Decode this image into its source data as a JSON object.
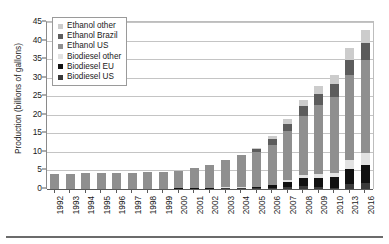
{
  "chart_data": {
    "type": "bar",
    "stacked": true,
    "title": "",
    "xlabel": "",
    "ylabel": "Production (billions of gallons)",
    "ylim": [
      0,
      45
    ],
    "ytick_step": 5,
    "yticks": [
      0,
      5,
      10,
      15,
      20,
      25,
      30,
      35,
      40,
      45
    ],
    "grid": true,
    "legend_position": "top-left",
    "categories": [
      "1992",
      "1993",
      "1994",
      "1995",
      "1996",
      "1997",
      "1998",
      "1999",
      "2000",
      "2001",
      "2002",
      "2003",
      "2004",
      "2005",
      "2006",
      "2007",
      "2008",
      "2009",
      "2010",
      "2013",
      "2016"
    ],
    "series": [
      {
        "name": "Biodiesel US",
        "color": "#3a3a3a",
        "values": [
          0,
          0,
          0,
          0,
          0,
          0,
          0,
          0,
          0,
          0,
          0,
          0.02,
          0.03,
          0.09,
          0.25,
          0.49,
          0.68,
          0.5,
          0.31,
          1.3,
          1.6
        ]
      },
      {
        "name": "Biodiesel EU",
        "color": "#111111",
        "values": [
          0,
          0,
          0,
          0,
          0,
          0,
          0,
          0,
          0.02,
          0.03,
          0.06,
          0.1,
          0.17,
          0.3,
          0.7,
          1.5,
          2.3,
          2.6,
          2.8,
          4.0,
          5.0
        ]
      },
      {
        "name": "Biodiesel other",
        "color": "#e2e2e2",
        "values": [
          0,
          0,
          0,
          0,
          0,
          0,
          0,
          0,
          0,
          0,
          0,
          0.02,
          0.05,
          0.1,
          0.2,
          0.4,
          0.7,
          1.0,
          1.3,
          2.5,
          3.2
        ]
      },
      {
        "name": "Ethanol US",
        "color": "#8f8f8f",
        "values": [
          4.0,
          4.1,
          4.2,
          4.3,
          4.4,
          4.4,
          4.5,
          4.6,
          4.8,
          5.4,
          6.2,
          7.2,
          8.5,
          9.2,
          10.8,
          13.2,
          16.0,
          18.5,
          20.5,
          23.0,
          25.0
        ]
      },
      {
        "name": "Ethanol Brazil",
        "color": "#5c5c5c",
        "values": [
          0,
          0,
          0,
          0,
          0,
          0,
          0,
          0,
          0,
          0,
          0,
          0,
          0,
          0.8,
          1.4,
          2.0,
          2.6,
          3.0,
          3.3,
          4.0,
          4.5
        ]
      },
      {
        "name": "Ethanol other",
        "color": "#cccccc",
        "values": [
          0,
          0,
          0,
          0,
          0,
          0,
          0,
          0,
          0,
          0,
          0,
          0.1,
          0.2,
          0.4,
          0.9,
          1.4,
          1.8,
          2.2,
          2.6,
          3.2,
          3.5
        ]
      }
    ],
    "legend_entries": [
      {
        "label": "Ethanol other",
        "color": "#cccccc"
      },
      {
        "label": "Ethanol Brazil",
        "color": "#5c5c5c"
      },
      {
        "label": "Ethanol US",
        "color": "#8f8f8f"
      },
      {
        "label": "Biodiesel other",
        "color": "#e2e2e2"
      },
      {
        "label": "Biodiesel EU",
        "color": "#111111"
      },
      {
        "label": "Biodiesel US",
        "color": "#3a3a3a"
      }
    ],
    "stack_order_bottom_to_top": [
      "Biodiesel US",
      "Biodiesel EU",
      "Biodiesel other",
      "Ethanol US",
      "Ethanol Brazil",
      "Ethanol other"
    ],
    "totals": [
      4.0,
      4.1,
      4.2,
      4.3,
      4.4,
      4.4,
      4.5,
      4.6,
      4.82,
      5.43,
      6.26,
      7.44,
      8.95,
      10.89,
      14.25,
      18.99,
      24.08,
      27.8,
      30.81,
      38.0,
      42.8
    ]
  }
}
